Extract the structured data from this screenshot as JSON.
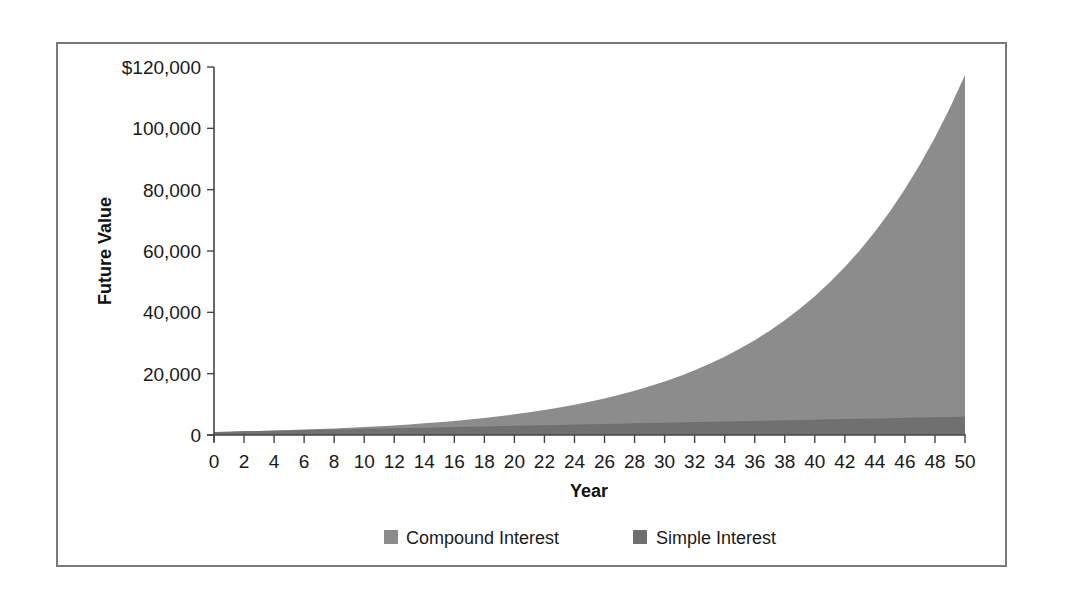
{
  "chart_data": {
    "type": "area",
    "title": "",
    "xlabel": "Year",
    "ylabel": "Future Value",
    "x": [
      0,
      1,
      2,
      3,
      4,
      5,
      6,
      7,
      8,
      9,
      10,
      11,
      12,
      13,
      14,
      15,
      16,
      17,
      18,
      19,
      20,
      21,
      22,
      23,
      24,
      25,
      26,
      27,
      28,
      29,
      30,
      31,
      32,
      33,
      34,
      35,
      36,
      37,
      38,
      39,
      40,
      41,
      42,
      43,
      44,
      45,
      46,
      47,
      48,
      49,
      50
    ],
    "x_ticks": [
      "0",
      "2",
      "4",
      "6",
      "8",
      "10",
      "12",
      "14",
      "16",
      "18",
      "20",
      "22",
      "24",
      "26",
      "28",
      "30",
      "32",
      "34",
      "36",
      "38",
      "40",
      "42",
      "44",
      "46",
      "48",
      "50"
    ],
    "y_ticks": [
      "0",
      "20,000",
      "40,000",
      "60,000",
      "80,000",
      "100,000",
      "$120,000"
    ],
    "y_tick_values": [
      0,
      20000,
      40000,
      60000,
      80000,
      100000,
      120000
    ],
    "xlim": [
      0,
      50
    ],
    "ylim": [
      0,
      120000
    ],
    "grid": false,
    "legend_position": "bottom",
    "series": [
      {
        "name": "Compound Interest",
        "color": "#8c8c8c",
        "values": [
          1000,
          1100,
          1210,
          1331,
          1464,
          1611,
          1772,
          1949,
          2144,
          2358,
          2594,
          2853,
          3138,
          3452,
          3797,
          4177,
          4595,
          5054,
          5560,
          6116,
          6727,
          7400,
          8140,
          8954,
          9850,
          10835,
          11918,
          13110,
          14421,
          15863,
          17449,
          19194,
          21114,
          23225,
          25548,
          28102,
          30913,
          34004,
          37404,
          41145,
          45259,
          49785,
          54764,
          60240,
          66264,
          72890,
          80180,
          88197,
          97017,
          106719,
          117391
        ]
      },
      {
        "name": "Simple Interest",
        "color": "#707070",
        "values": [
          1000,
          1100,
          1200,
          1300,
          1400,
          1500,
          1600,
          1700,
          1800,
          1900,
          2000,
          2100,
          2200,
          2300,
          2400,
          2500,
          2600,
          2700,
          2800,
          2900,
          3000,
          3100,
          3200,
          3300,
          3400,
          3500,
          3600,
          3700,
          3800,
          3900,
          4000,
          4100,
          4200,
          4300,
          4400,
          4500,
          4600,
          4700,
          4800,
          4900,
          5000,
          5100,
          5200,
          5300,
          5400,
          5500,
          5600,
          5700,
          5800,
          5900,
          6000
        ]
      }
    ]
  },
  "legend": {
    "items": [
      {
        "label": "Compound Interest",
        "color": "#8c8c8c"
      },
      {
        "label": "Simple Interest",
        "color": "#707070"
      }
    ]
  }
}
